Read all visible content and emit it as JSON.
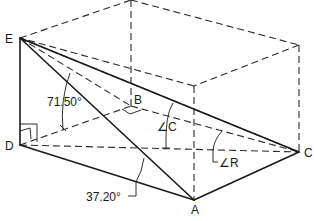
{
  "diagram": {
    "type": "descriptive-geometry-box",
    "points": {
      "E": "E",
      "D": "D",
      "B": "B",
      "C": "C",
      "A": "A"
    },
    "angles": {
      "angle_1": "71.50°",
      "angle_2": "37.20°",
      "angle_C": "∠C",
      "angle_R": "∠R"
    },
    "colors": {
      "line": "#1a1a1a",
      "background": "#ffffff"
    }
  }
}
